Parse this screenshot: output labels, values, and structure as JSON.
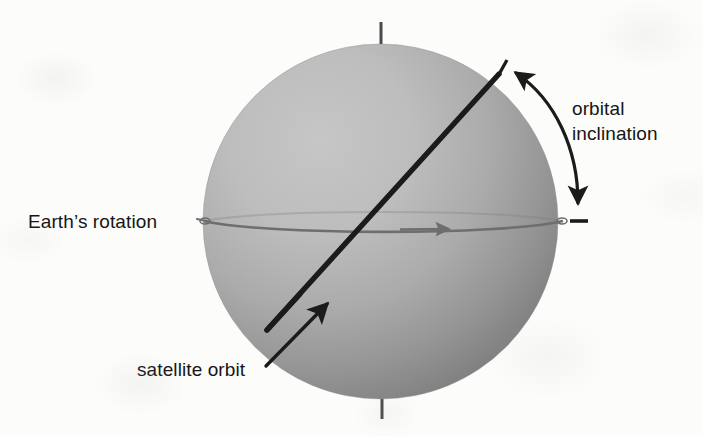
{
  "figure": {
    "width": 703,
    "height": 436,
    "background_color": "#fcfcfb"
  },
  "labels": {
    "earth_rotation": "Earth’s rotation",
    "orbital_inclination_line1": "orbital",
    "orbital_inclination_line2": "inclination",
    "satellite_orbit": "satellite orbit"
  },
  "colors": {
    "sphere_light": "#c2c2c2",
    "sphere_mid": "#a8a8a8",
    "sphere_dark": "#7d7d7d",
    "equator_line": "#6e6e6e",
    "orbit_line": "#1b1b1b",
    "axis_line": "#4a4a4a",
    "text": "#151515",
    "background": "#fcfcfb"
  },
  "elements": {
    "earth_sphere": "shaded gray sphere",
    "rotation_axis": "vertical polar axis stub at top and bottom",
    "equator": "near edge-on ellipse across the sphere with rightward arrowhead",
    "satellite_orbit": "inclined great-circle line from lower-left to upper-right",
    "inclination_arc": "double-headed curved arrow between orbit plane and equator plane",
    "equator_tick": "short horizontal dash marking the equatorial plane at the right",
    "orbit_tick": "short slanted dash marking the orbit plane at the top right",
    "satellite_orbit_leader": "arrow leader line from the label to the orbit line"
  }
}
